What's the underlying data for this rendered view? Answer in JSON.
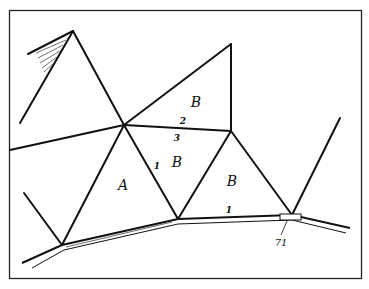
{
  "diagram": {
    "type": "triangulation-network-sketch",
    "regions": [
      {
        "id": "A",
        "label": "A",
        "x": 123,
        "y": 190
      },
      {
        "id": "B-top",
        "label": "B",
        "x": 196,
        "y": 107
      },
      {
        "id": "B-mid",
        "label": "B",
        "x": 177,
        "y": 167
      },
      {
        "id": "B-right",
        "label": "B",
        "x": 232,
        "y": 186
      }
    ],
    "edge_labels": [
      {
        "label": "2",
        "x": 183,
        "y": 124
      },
      {
        "label": "3",
        "x": 177,
        "y": 141
      },
      {
        "label": "1",
        "x": 157,
        "y": 169
      },
      {
        "label": "1",
        "x": 229,
        "y": 213
      }
    ],
    "callout": {
      "label": "71",
      "x": 281,
      "y": 246
    },
    "colors": {
      "line": "#111111",
      "background": "#ffffff"
    }
  }
}
